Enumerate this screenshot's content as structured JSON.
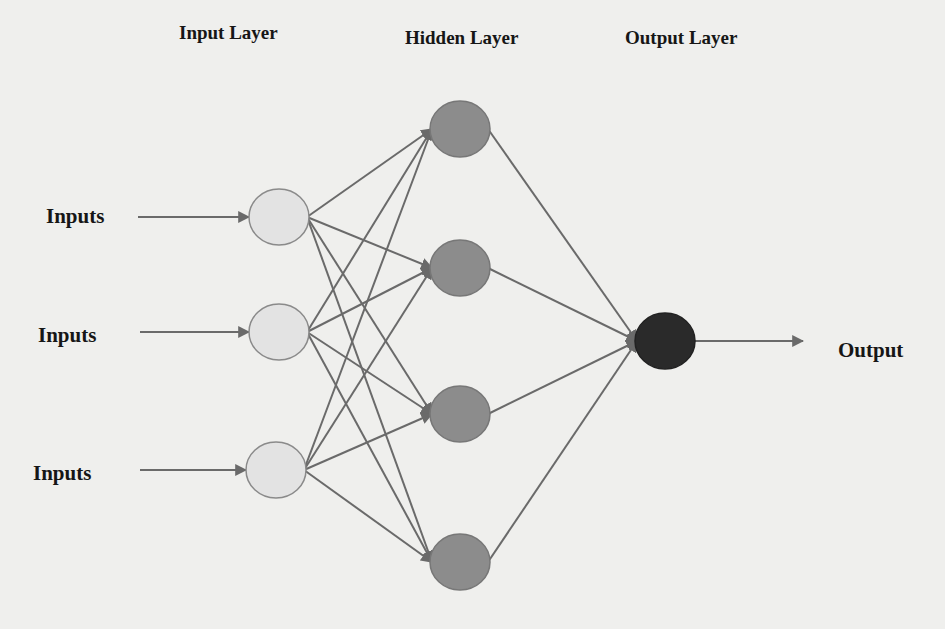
{
  "headers": {
    "input_layer": "Input Layer",
    "hidden_layer": "Hidden Layer",
    "output_layer": "Output Layer"
  },
  "inputs": [
    {
      "label": "Inputs"
    },
    {
      "label": "Inputs"
    },
    {
      "label": "Inputs"
    }
  ],
  "output_label": "Output",
  "colors": {
    "background": "#efefed",
    "input_node_fill": "#e3e3e3",
    "hidden_node_fill": "#8c8c8c",
    "output_node_fill": "#2a2a2a",
    "edge": "#6a6a6a",
    "text": "#161616"
  },
  "nodes": {
    "input": [
      {
        "cx": 279,
        "cy": 217
      },
      {
        "cx": 279,
        "cy": 332
      },
      {
        "cx": 276,
        "cy": 470
      }
    ],
    "hidden": [
      {
        "cx": 460,
        "cy": 129
      },
      {
        "cx": 460,
        "cy": 268
      },
      {
        "cx": 460,
        "cy": 414
      },
      {
        "cx": 460,
        "cy": 562
      }
    ],
    "output": [
      {
        "cx": 665,
        "cy": 341
      }
    ]
  }
}
